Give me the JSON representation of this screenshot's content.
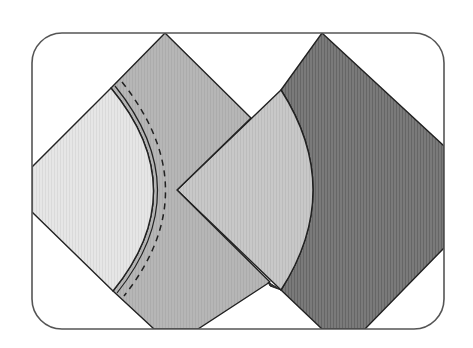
{
  "diagram": {
    "frame": {
      "x": 32,
      "y": 33,
      "width": 412,
      "height": 296,
      "radius": 30,
      "stroke": "#555555"
    },
    "colors": {
      "light_fabric": "#e4e4e4",
      "medium_fabric": "#b4b4b4",
      "light_fan": "#c6c6c6",
      "dark_fabric": "#757575",
      "outline": "#222222"
    },
    "pieces": [
      {
        "name": "light-quarter-circle",
        "label": "Light curved piece (left)"
      },
      {
        "name": "medium-diamond",
        "label": "Medium square set on point with concave curve"
      },
      {
        "name": "light-fan",
        "label": "Light curved piece (right)"
      },
      {
        "name": "dark-diamond",
        "label": "Dark square set on point with concave curve"
      }
    ],
    "seam": {
      "style": "dashed",
      "label": "Seam line"
    }
  }
}
